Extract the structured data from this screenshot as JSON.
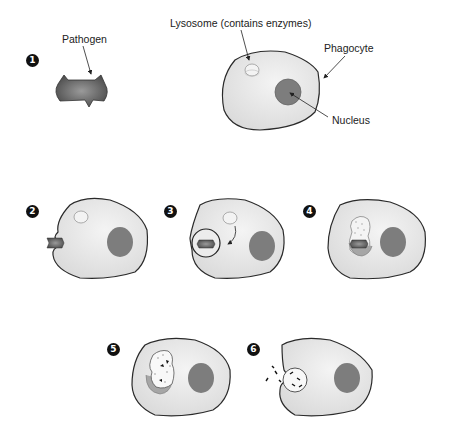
{
  "labels": {
    "pathogen": "Pathogen",
    "lysosome": "Lysosome (contains enzymes)",
    "phagocyte": "Phagocyte",
    "nucleus": "Nucleus"
  },
  "steps": [
    {
      "number": "1",
      "description": "Pathogen approaches phagocyte"
    },
    {
      "number": "2",
      "description": "Phagocyte engulfs pathogen"
    },
    {
      "number": "3",
      "description": "Pathogen enclosed in vesicle; lysosome moves toward it"
    },
    {
      "number": "4",
      "description": "Lysosome fuses with vesicle"
    },
    {
      "number": "5",
      "description": "Enzymes digest pathogen"
    },
    {
      "number": "6",
      "description": "Debris released from cell"
    }
  ],
  "colors": {
    "cell_fill": "#e6e6e6",
    "cell_stroke": "#2a2a2a",
    "nucleus": "#7d7d7d",
    "pathogen": "#6a6a6a",
    "lysosome": "#f3f3f3",
    "badge": "#111111"
  }
}
